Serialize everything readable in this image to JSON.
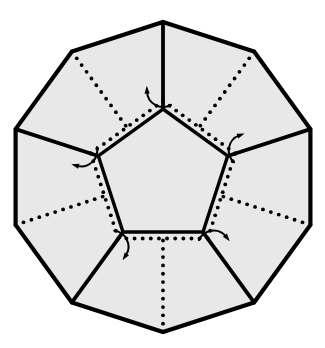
{
  "figure": {
    "kind": "geometric-line-drawing",
    "background_color": "#ffffff",
    "face_fill_color": "#e8e8e8",
    "stroke_color": "#000000",
    "arrow_color": "#000000",
    "canvas": {
      "width": 325,
      "height": 348
    }
  },
  "geometry": {
    "center": {
      "x": 163,
      "y": 177
    },
    "outer_polygon": {
      "name": "decagon",
      "sides": 10,
      "circumradius": 155,
      "start_angle_deg": -90,
      "stroke_width": 4.2,
      "vertices": [
        {
          "x": 163,
          "y": 22
        },
        {
          "x": 254,
          "y": 88
        },
        {
          "x": 310,
          "y": 177
        },
        {
          "x": 254,
          "y": 266
        },
        {
          "x": 163,
          "y": 332
        },
        {
          "x": 72,
          "y": 266
        },
        {
          "x": 16,
          "y": 177
        },
        {
          "x": 72,
          "y": 88
        }
      ]
    },
    "inner_polygon": {
      "name": "central-pentagon",
      "sides": 5,
      "circumradius": 68,
      "start_angle_deg": -90,
      "stroke_width": 3.4,
      "vertices": [
        {
          "x": 163,
          "y": 109
        },
        {
          "x": 228,
          "y": 156
        },
        {
          "x": 203,
          "y": 232
        },
        {
          "x": 123,
          "y": 232
        },
        {
          "x": 98,
          "y": 156
        }
      ]
    },
    "spokes": {
      "name": "solid-radial-edges",
      "count": 5,
      "description": "solid lines joining each central pentagon vertex outward to an outer decagon vertex",
      "stroke_width": 3.8
    },
    "fold_lines": {
      "name": "dotted-fold-lines",
      "count": 5,
      "description": "dotted lines from alternate decagon vertices inward to the dotted pentagon",
      "dot_radius": 1.9,
      "dot_spacing": 8.0
    },
    "dotted_pentagon": {
      "name": "dotted-inner-pentagon",
      "circumradius": 76,
      "start_angle_deg": -90,
      "dot_radius": 1.9,
      "dot_spacing": 8.5
    }
  },
  "arrows": {
    "count": 5,
    "label": "fold-direction-arrows",
    "stroke_width": 2.0,
    "head_size": 6,
    "items": [
      {
        "id": "arrow-top-left",
        "angle_deg": -90,
        "direction": "counterclockwise"
      },
      {
        "id": "arrow-top-right",
        "angle_deg": -18,
        "direction": "counterclockwise"
      },
      {
        "id": "arrow-right",
        "angle_deg": 54,
        "direction": "counterclockwise"
      },
      {
        "id": "arrow-bottom",
        "angle_deg": 126,
        "direction": "counterclockwise"
      },
      {
        "id": "arrow-left",
        "angle_deg": 198,
        "direction": "counterclockwise"
      }
    ]
  },
  "faces": {
    "count": 6,
    "names": [
      "central-pentagon-face",
      "outer-face-top",
      "outer-face-right",
      "outer-face-bottom-right",
      "outer-face-bottom-left",
      "outer-face-left"
    ]
  }
}
